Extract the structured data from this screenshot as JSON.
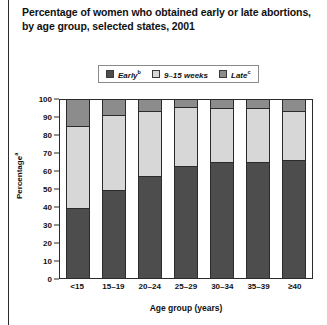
{
  "title": {
    "line1": "Percentage of women who obtained early or late abortions,",
    "line2": "by age group, selected states, 2001"
  },
  "legend": {
    "items": [
      {
        "label": "Early",
        "sup": "b",
        "color": "#4d4d4d"
      },
      {
        "label": "9–15 weeks",
        "sup": "",
        "color": "#d7d7d7"
      },
      {
        "label": "Late",
        "sup": "c",
        "color": "#8c8c8c"
      }
    ]
  },
  "axes": {
    "ylabel": "Percentage",
    "ylabel_sup": "a",
    "xlabel": "Age group (years)",
    "yticks": [
      "0",
      "10",
      "20",
      "30",
      "40",
      "50",
      "60",
      "70",
      "80",
      "90",
      "100"
    ]
  },
  "chart_data": {
    "type": "bar",
    "stacked": true,
    "title": "Percentage of women who obtained early or late abortions, by age group, selected states, 2001",
    "xlabel": "Age group (years)",
    "ylabel": "Percentage",
    "ylim": [
      0,
      100
    ],
    "ytick_step": 10,
    "grid": false,
    "legend_position": "top-center",
    "categories": [
      "<15",
      "15–19",
      "20–24",
      "25–29",
      "30–34",
      "35–39",
      "≥40"
    ],
    "series": [
      {
        "name": "Early",
        "color": "#4d4d4d",
        "values": [
          38.5,
          49.0,
          57.0,
          62.5,
          64.5,
          64.5,
          66.0
        ]
      },
      {
        "name": "9–15 weeks",
        "color": "#d7d7d7",
        "values": [
          46.5,
          42.0,
          36.5,
          33.0,
          30.5,
          30.5,
          27.0
        ]
      },
      {
        "name": "Late",
        "color": "#8c8c8c",
        "values": [
          15.0,
          9.0,
          6.5,
          4.5,
          5.0,
          5.0,
          7.0
        ]
      }
    ],
    "cumulative_tops": {
      "early": [
        38.5,
        49.0,
        57.0,
        62.5,
        64.5,
        64.5,
        66.0
      ],
      "mid": [
        85.0,
        91.0,
        93.5,
        95.5,
        95.0,
        95.0,
        93.0
      ],
      "late": [
        100,
        100,
        100,
        100,
        100,
        100,
        100
      ]
    }
  }
}
